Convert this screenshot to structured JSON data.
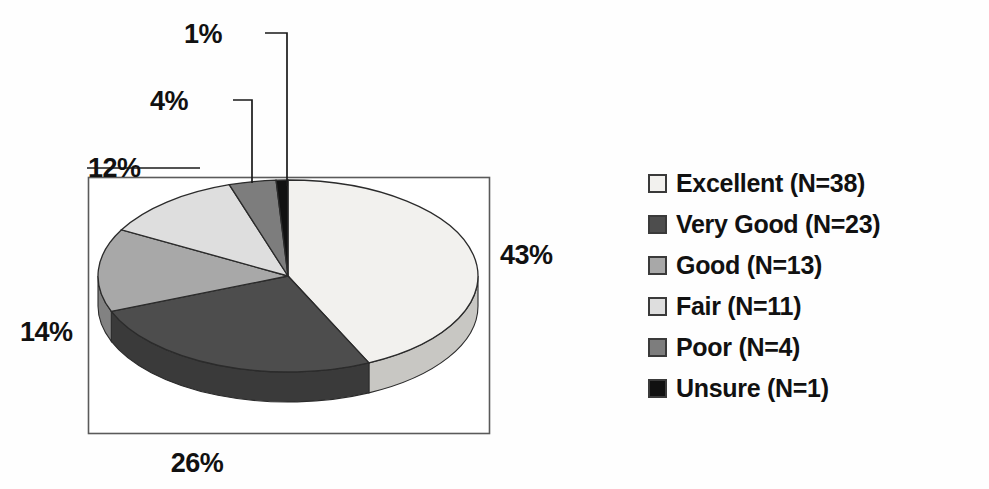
{
  "chart_data": {
    "type": "pie",
    "title": "",
    "subtitle": "",
    "xlabel": "",
    "ylabel": "",
    "three_d": true,
    "legend_position": "right",
    "grid": false,
    "start_angle_deg": 0,
    "direction": "clockwise",
    "total_n": 90,
    "categories": [
      "Excellent",
      "Very Good",
      "Good",
      "Fair",
      "Poor",
      "Unsure"
    ],
    "values": [
      43,
      26,
      14,
      12,
      4,
      1
    ],
    "counts": [
      38,
      23,
      13,
      11,
      4,
      1
    ],
    "value_labels": [
      "43%",
      "26%",
      "14%",
      "12%",
      "4%",
      "1%"
    ],
    "colors": [
      "#f2f1ee",
      "#4d4d4d",
      "#a8a8a8",
      "#dedede",
      "#7d7d7d",
      "#111111"
    ],
    "slices": [
      {
        "name": "Excellent",
        "percent": 43,
        "count": 38,
        "label": "43%",
        "legend": "Excellent (N=38)",
        "color": "#f2f1ee",
        "side_color": "#c8c7c3"
      },
      {
        "name": "Very Good",
        "percent": 26,
        "count": 23,
        "label": "26%",
        "legend": "Very Good (N=23)",
        "color": "#4d4d4d",
        "side_color": "#3a3a3a"
      },
      {
        "name": "Good",
        "percent": 14,
        "count": 13,
        "label": "14%",
        "legend": "Good (N=13)",
        "color": "#a8a8a8",
        "side_color": "#828282"
      },
      {
        "name": "Fair",
        "percent": 12,
        "count": 11,
        "label": "12%",
        "legend": "Fair (N=11)",
        "color": "#dedede",
        "side_color": "#b2b2b2"
      },
      {
        "name": "Poor",
        "percent": 4,
        "count": 4,
        "label": "4%",
        "legend": "Poor (N=4)",
        "color": "#7d7d7d",
        "side_color": "#5e5e5e"
      },
      {
        "name": "Unsure",
        "percent": 1,
        "count": 1,
        "label": "1%",
        "legend": "Unsure (N=1)",
        "color": "#111111",
        "side_color": "#0a0a0a"
      }
    ]
  },
  "plot_area": {
    "border_color": "#5a5a5a",
    "background": "#ffffff"
  },
  "labels": {
    "excellent_pct": "43%",
    "very_good_pct": "26%",
    "good_pct": "14%",
    "fair_pct": "12%",
    "poor_pct": "4%",
    "unsure_pct": "1%"
  },
  "legend": {
    "items": [
      {
        "label": "Excellent (N=38)",
        "color": "#f2f1ee"
      },
      {
        "label": "Very Good (N=23)",
        "color": "#4d4d4d"
      },
      {
        "label": "Good (N=13)",
        "color": "#a8a8a8"
      },
      {
        "label": "Fair (N=11)",
        "color": "#dedede"
      },
      {
        "label": "Poor (N=4)",
        "color": "#7d7d7d"
      },
      {
        "label": "Unsure (N=1)",
        "color": "#111111"
      }
    ]
  }
}
